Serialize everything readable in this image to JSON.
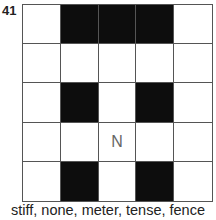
{
  "puzzle": {
    "number": "41",
    "grid": [
      [
        "",
        "#",
        "#",
        "#",
        ""
      ],
      [
        "",
        "",
        "",
        "",
        ""
      ],
      [
        "",
        "#",
        "",
        "#",
        ""
      ],
      [
        "",
        "",
        "N",
        "",
        ""
      ],
      [
        "",
        "#",
        "",
        "#",
        ""
      ]
    ],
    "clue_words": "stiff, none, meter, tense, fence"
  },
  "colors": {
    "black_cell": "#0d0d0d",
    "white_cell": "#ffffff",
    "grid_line": "#555555"
  }
}
